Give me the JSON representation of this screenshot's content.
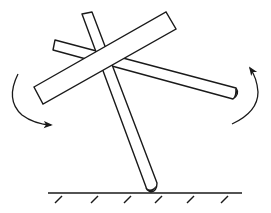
{
  "diagram": {
    "description": "Three crossed rigid bars pivoting on a ground point, with curved rotation arrows",
    "colors": {
      "stroke": "#1a1a1a",
      "fill": "#ffffff",
      "background": "#ffffff"
    },
    "elements": {
      "ground": {
        "x1": 48,
        "x2": 242,
        "y": 193,
        "hatch_x": [
          57,
          93,
          126,
          157,
          189,
          223
        ]
      },
      "vertical_rod": {
        "top_left": [
          82,
          14
        ],
        "top_right": [
          92,
          12
        ],
        "bottom_left": [
          146,
          187
        ],
        "bottom_right": [
          157,
          183
        ],
        "tip": [
          152,
          191
        ]
      },
      "slanted_rod": {
        "left_top": [
          55,
          40
        ],
        "left_bottom": [
          53,
          50
        ],
        "right_top": [
          236,
          88
        ],
        "right_bottom": [
          233,
          99
        ]
      },
      "large_bar": {
        "left_top": [
          34,
          87
        ],
        "left_bottom": [
          43,
          104
        ],
        "right_top": [
          166,
          12
        ],
        "right_bottom": [
          176,
          29
        ]
      },
      "left_arrow": {
        "direction": "counterclockwise-down",
        "start": [
          18,
          74
        ],
        "end": [
          52,
          125
        ]
      },
      "right_arrow": {
        "direction": "counterclockwise-up",
        "start": [
          232,
          124
        ],
        "end": [
          250,
          67
        ]
      }
    }
  }
}
